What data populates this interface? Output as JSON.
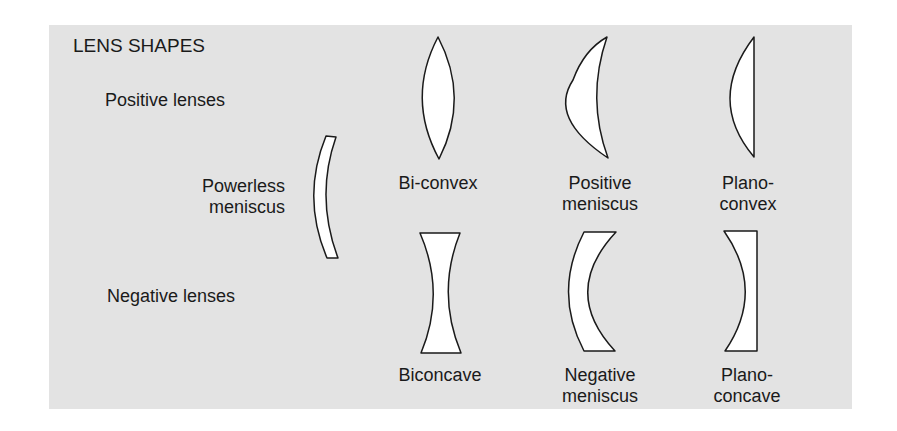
{
  "diagram": {
    "title": "LENS SHAPES",
    "background_color": "#e3e3e3",
    "lens_fill": "#ffffff",
    "outline_color": "#1a1a1a",
    "row_labels": {
      "positive": "Positive lenses",
      "negative": "Negative lenses"
    },
    "powerless": {
      "line1": "Powerless",
      "line2": "meniscus"
    },
    "positive_lenses": [
      {
        "shape": "biconvex",
        "line1": "Bi-convex",
        "line2": ""
      },
      {
        "shape": "positive-meniscus",
        "line1": "Positive",
        "line2": "meniscus"
      },
      {
        "shape": "plano-convex",
        "line1": "Plano-",
        "line2": "convex"
      }
    ],
    "negative_lenses": [
      {
        "shape": "biconcave",
        "line1": "Biconcave",
        "line2": ""
      },
      {
        "shape": "negative-meniscus",
        "line1": "Negative",
        "line2": "meniscus"
      },
      {
        "shape": "plano-concave",
        "line1": "Plano-",
        "line2": "concave"
      }
    ]
  }
}
